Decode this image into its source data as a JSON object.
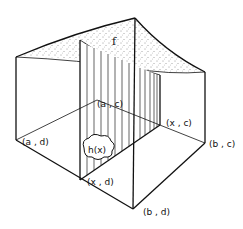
{
  "diagram": {
    "surface_label": "f",
    "region_label": "h(x)",
    "corners": {
      "a_d": "(a , d)",
      "a_c": "(a , c)",
      "x_c": "(x , c)",
      "x_d": "(x , d)",
      "b_c": "(b , c)",
      "b_d": "(b , d)"
    },
    "colors": {
      "line": "#111111",
      "background": "#ffffff",
      "stipple": "#333333"
    }
  }
}
